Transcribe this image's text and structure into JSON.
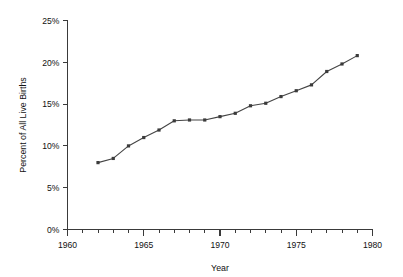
{
  "chart_data": {
    "type": "line",
    "title": "",
    "xlabel": "Year",
    "ylabel": "Percent of All Live Births",
    "xlim": [
      1960,
      1980
    ],
    "ylim": [
      0,
      25
    ],
    "grid": false,
    "legend": null,
    "x_tick_labels": [
      "1960",
      "1965",
      "1970",
      "1975",
      "1980"
    ],
    "x_tick_values": [
      1960,
      1965,
      1970,
      1975,
      1980
    ],
    "x_minor_tick_step": 1,
    "y_tick_labels": [
      "0%",
      "5%",
      "10%",
      "15%",
      "20%",
      "25%"
    ],
    "y_tick_values": [
      0,
      5,
      10,
      15,
      20,
      25
    ],
    "marker": "square",
    "series": [
      {
        "name": "Percent of All Live Births",
        "color": "#3b3b3b",
        "x": [
          1962,
          1963,
          1964,
          1965,
          1966,
          1967,
          1968,
          1969,
          1970,
          1971,
          1972,
          1973,
          1974,
          1975,
          1976,
          1977,
          1978,
          1979
        ],
        "values": [
          8.0,
          8.5,
          10.0,
          11.0,
          11.9,
          13.0,
          13.1,
          13.1,
          13.5,
          13.9,
          14.8,
          15.1,
          15.9,
          16.6,
          17.3,
          18.9,
          19.8,
          20.8
        ]
      }
    ]
  }
}
